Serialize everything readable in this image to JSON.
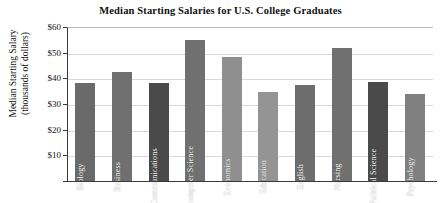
{
  "chart_data": {
    "type": "bar",
    "title": "Median Starting Salaries for U.S. College Graduates",
    "xlabel": "",
    "ylabel": "Median Starting Salary (thousands of dollars)",
    "ylabel_lines": [
      "Median Starting Salary",
      "(thousands of dollars)"
    ],
    "ylim": [
      0,
      60
    ],
    "ytick_values": [
      10,
      20,
      30,
      40,
      50,
      60
    ],
    "ytick_labels": [
      "$10",
      "$20",
      "$30",
      "$40",
      "$50",
      "$60"
    ],
    "grid": true,
    "legend": "none",
    "units": "thousands of dollars",
    "categories": [
      "Biology",
      "Business",
      "Communications",
      "Computer Science",
      "Economics",
      "Education",
      "English",
      "Nursing",
      "Political Science",
      "Psychology"
    ],
    "values": [
      38,
      42.5,
      38,
      55,
      48.5,
      34.5,
      37.5,
      52,
      38.5,
      34
    ],
    "bar_colors": [
      "#6a6a6a",
      "#6f6f6f",
      "#4a4a4a",
      "#707070",
      "#8f8f8f",
      "#949494",
      "#6d6d6d",
      "#707070",
      "#4a4a4a",
      "#808080"
    ]
  },
  "axis": {
    "tick_color": "#3a3a3a",
    "grid_color": "#d8d8d8"
  }
}
